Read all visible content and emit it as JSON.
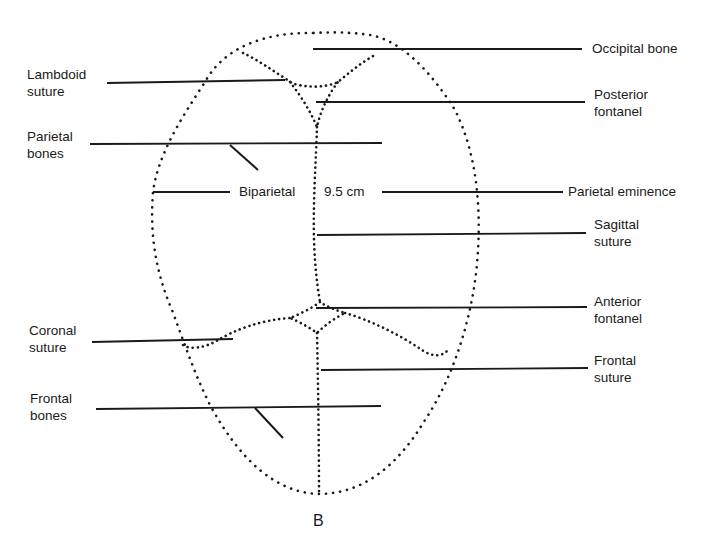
{
  "figure": {
    "caption": "B",
    "colors": {
      "ink": "#1a1a1a",
      "background": "#ffffff"
    }
  },
  "labels": {
    "left": [
      {
        "id": "lambdoid-suture",
        "line1": "Lambdoid",
        "line2": "suture"
      },
      {
        "id": "parietal-bones",
        "line1": "Parietal",
        "line2": "bones"
      },
      {
        "id": "coronal-suture",
        "line1": "Coronal",
        "line2": "suture"
      },
      {
        "id": "frontal-bones",
        "line1": "Frontal",
        "line2": "bones"
      }
    ],
    "right": [
      {
        "id": "occipital-bone",
        "line1": "Occipital bone",
        "line2": ""
      },
      {
        "id": "posterior-fontanel",
        "line1": "Posterior",
        "line2": "fontanel"
      },
      {
        "id": "parietal-eminence",
        "line1": "Parietal eminence",
        "line2": ""
      },
      {
        "id": "sagittal-suture",
        "line1": "Sagittal",
        "line2": "suture"
      },
      {
        "id": "anterior-fontanel",
        "line1": "Anterior",
        "line2": "fontanel"
      },
      {
        "id": "frontal-suture",
        "line1": "Frontal",
        "line2": "suture"
      }
    ],
    "center": {
      "biparietal": "Biparietal",
      "measurement": "9.5 cm"
    }
  }
}
